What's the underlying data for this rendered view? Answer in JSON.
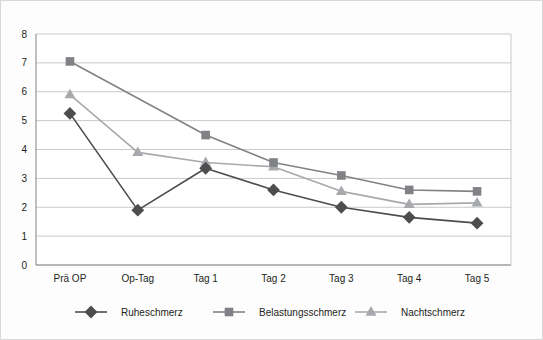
{
  "chart_data": {
    "type": "line",
    "title": "",
    "subtitle": "",
    "xlabel": "",
    "ylabel": "",
    "categories": [
      "Prä OP",
      "Op-Tag",
      "Tag 1",
      "Tag 2",
      "Tag 3",
      "Tag 4",
      "Tag 5"
    ],
    "ylim": [
      0,
      8
    ],
    "yticks": [
      0,
      1,
      2,
      3,
      4,
      5,
      6,
      7,
      8
    ],
    "ytick_labels": [
      "0",
      "1",
      "2",
      "3",
      "4",
      "5",
      "6",
      "7",
      "8"
    ],
    "grid": "horizontal",
    "legend_position": "bottom",
    "series": [
      {
        "name": "Ruheschmerz",
        "marker": "diamond",
        "color": "#4d4d4f",
        "values": [
          5.25,
          1.9,
          3.35,
          2.6,
          2.0,
          1.65,
          1.45
        ]
      },
      {
        "name": "Belastungsschmerz",
        "marker": "square",
        "color": "#808285",
        "values": [
          7.05,
          null,
          4.5,
          3.55,
          3.1,
          2.6,
          2.55
        ]
      },
      {
        "name": "Nachtschmerz",
        "marker": "triangle",
        "color": "#a7a9ac",
        "values": [
          5.9,
          3.9,
          3.55,
          3.4,
          2.55,
          2.1,
          2.15
        ]
      }
    ]
  },
  "colors": {
    "background": "#fdfdfd",
    "border": "#d8d8d8",
    "gridline": "#c8c9ca",
    "axis": "#8c8c8c",
    "text": "#231f20"
  }
}
